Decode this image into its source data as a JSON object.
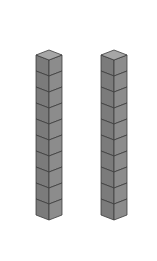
{
  "figure": {
    "rods": [
      {
        "label": "rod-1",
        "cube_count": 10,
        "center_x": 49
      },
      {
        "label": "rod-2",
        "cube_count": 10,
        "center_x": 114
      }
    ],
    "geometry": {
      "half_width": 13,
      "top_y": 50,
      "diamond_half_height": 5,
      "cube_height": 16
    },
    "colors": {
      "background": "#ffffff",
      "top_face": "#a6a6a6",
      "left_face": "#7b7b7b",
      "right_face": "#8c8c8c",
      "edge": "#3c3c3c"
    }
  }
}
